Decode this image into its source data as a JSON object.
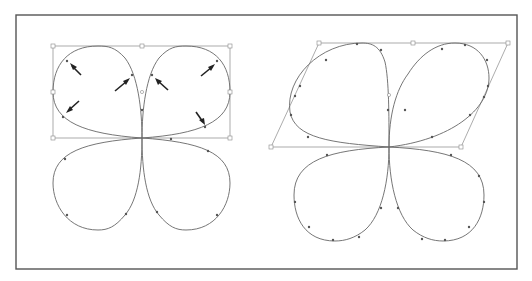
{
  "figure": {
    "colors": {
      "frame": "#555555",
      "curve": "#666666",
      "bounding_box": "#888888",
      "arrow": "#222222",
      "background": "#ffffff"
    },
    "panels": [
      {
        "id": "left",
        "transform": "none",
        "bounding_box": "rectangle",
        "arrow_count": 6
      },
      {
        "id": "right",
        "transform": "skew",
        "bounding_box": "parallelogram",
        "arrow_count": 0
      }
    ]
  }
}
